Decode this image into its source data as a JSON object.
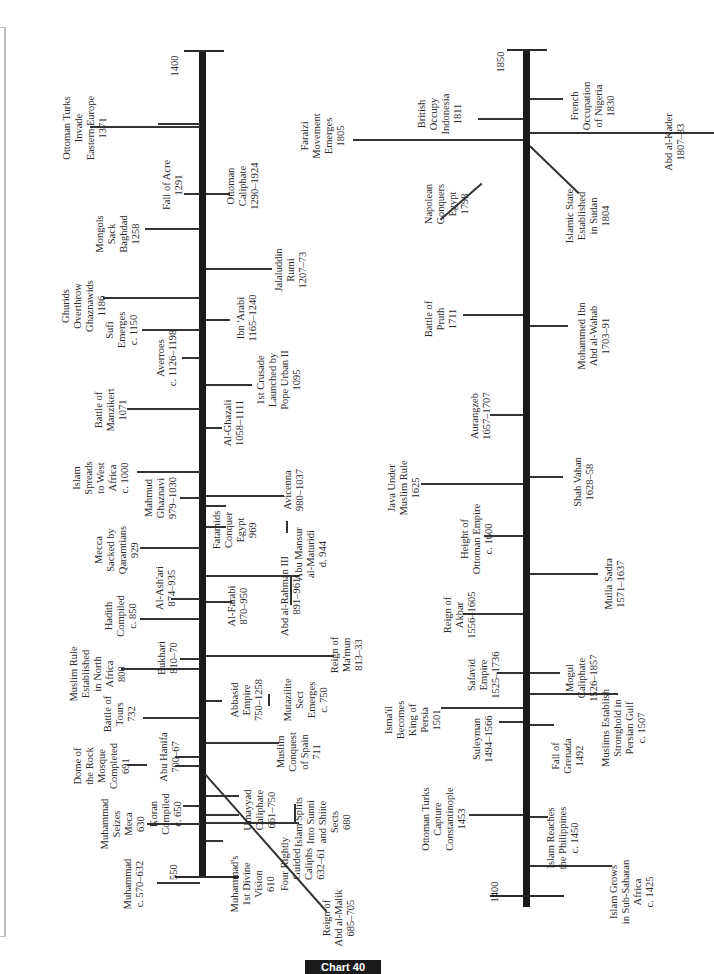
{
  "diagram": {
    "title": "Chart 40",
    "left_timeline": {
      "start_label": "550",
      "end_label": "1400",
      "events": [
        {
          "id": "muhammad",
          "text": "Muhammad\nc. 570–632"
        },
        {
          "id": "vision",
          "text": "Muhammad's\n1st Divine\nVision\n610"
        },
        {
          "id": "seizes-mecca",
          "text": "Muhammad\nSeizes\nMeca\n630"
        },
        {
          "id": "four-caliphs",
          "text": "Four Rightly\nGuided\nCaliphs\n632–61"
        },
        {
          "id": "koran",
          "text": "Koran\nCompiled\nc. 650"
        },
        {
          "id": "umayyad",
          "text": "Umayyad\nCaliphate\n661–750"
        },
        {
          "id": "split",
          "text": "Islam Splits\nInto Sunni\nand Shiite\nSects\n680"
        },
        {
          "id": "abd-al-malik",
          "text": "Reign of\nAbd al-Malik\n685–705"
        },
        {
          "id": "dome",
          "text": "Dome of\nthe Rock\nMosque\nCompleted\n691"
        },
        {
          "id": "abu-hanifa",
          "text": "Abu Hanifa\n700–67"
        },
        {
          "id": "spain",
          "text": "Muslim\nConquest\nof Spain\n711"
        },
        {
          "id": "tours",
          "text": "Battle of\nTours\n732"
        },
        {
          "id": "abbasid",
          "text": "Abbasid\nEmpire\n750–1258"
        },
        {
          "id": "mutazilite",
          "text": "Mutazilite\nSect\nEmerges\nc. 750"
        },
        {
          "id": "north-africa",
          "text": "Muslim Rule\nEstablished\nin North\nAfrica\n800"
        },
        {
          "id": "bukhari",
          "text": "Bukhari\n810–70"
        },
        {
          "id": "mamun",
          "text": "Reign of\nMa'mun\n813–33"
        },
        {
          "id": "hadith",
          "text": "Hadith\nCompiled\nc. 850"
        },
        {
          "id": "farabi",
          "text": "Al-Farabi\n870–950"
        },
        {
          "id": "ashari",
          "text": "Al-Ash'ari\n874–935"
        },
        {
          "id": "abd-rahman",
          "text": "Abd al-Rahman III\n891–961"
        },
        {
          "id": "mecca-sacked",
          "text": "Mecca\nSacked by\nQaramtians\n929"
        },
        {
          "id": "maturidi",
          "text": "Abu Mansur\nal-Maturidi\nd. 944"
        },
        {
          "id": "fatamids",
          "text": "Fatamids\nConquer\nEgypt\n969"
        },
        {
          "id": "mahmud",
          "text": "Mahmud\nGhaznavi\n979–1030"
        },
        {
          "id": "avicenna",
          "text": "Avicenna\n980–1037"
        },
        {
          "id": "west-africa",
          "text": "Islam\nSpreads\nto West\nAfrica\nc. 1000"
        },
        {
          "id": "ghazali",
          "text": "Al-Ghazali\n1058–1111"
        },
        {
          "id": "manzikert",
          "text": "Battle of\nManzikert\n1071"
        },
        {
          "id": "crusade",
          "text": "1st Crusade\nLaunched by\nPope Urban II\n1095"
        },
        {
          "id": "averroes",
          "text": "Averroes\nc. 1126–1198"
        },
        {
          "id": "sufi",
          "text": "Sufi\nEmerges\nc. 1150"
        },
        {
          "id": "ibn-arabi",
          "text": "Ibn 'Arabi\n1165–1240"
        },
        {
          "id": "ghurids",
          "text": "Ghurids\nOverthrow\nGhaznawids\n1186"
        },
        {
          "id": "rumi",
          "text": "Jalaluddin\nRumi\n1207–73"
        },
        {
          "id": "baghdad",
          "text": "Mongols\nSack\nBaghdad\n1258"
        },
        {
          "id": "ottoman-caliphate",
          "text": "Ottoman\nCaliphate\n1290–1924"
        },
        {
          "id": "acre",
          "text": "Fall of Acre\n1291"
        },
        {
          "id": "ottoman-invade",
          "text": "Ottoman Turks\nInvade\nEastern Europe\n1371"
        }
      ]
    },
    "right_timeline": {
      "start_label": "1400",
      "end_label": "1850",
      "events": [
        {
          "id": "sub-saharan",
          "text": "Islam Grows\nin Sub-Saharan\nAfrica\nc. 1425"
        },
        {
          "id": "philippines",
          "text": "Islam Reaches\nthe Philippines\nc. 1450"
        },
        {
          "id": "constantinople",
          "text": "Ottoman Turks\nCapture\nConstantinople\n1453"
        },
        {
          "id": "grenada",
          "text": "Fall of\nGrenada\n1492"
        },
        {
          "id": "suleyman",
          "text": "Suleyman\n1494–1566"
        },
        {
          "id": "ismail",
          "text": "Isma'il\nBecomes\nKing of\nPersia\n1501"
        },
        {
          "id": "persian-gulf",
          "text": "Muslims Establish\nStronghold in\nPersian Gulf\nc. 1507"
        },
        {
          "id": "safavid",
          "text": "Safavid\nEmpire\n1525–1736"
        },
        {
          "id": "mogul",
          "text": "Mogul\nCaliphate\n1526–1857"
        },
        {
          "id": "akbar",
          "text": "Reign of\nAkbar\n1556–1605"
        },
        {
          "id": "mulla-sadra",
          "text": "Mulla Sadra\n1571–1637"
        },
        {
          "id": "height-ottoman",
          "text": "Height of\nOttoman Empire\nc. 1600"
        },
        {
          "id": "java",
          "text": "Java Under\nMuslim Rule\n1625"
        },
        {
          "id": "shah-vahan",
          "text": "Shah Vahan\n1628–58"
        },
        {
          "id": "aurangzeb",
          "text": "Aurangzeb\n1657–1707"
        },
        {
          "id": "wahab",
          "text": "Mohammed Ibn\nAbd al-Wahab\n1703–91"
        },
        {
          "id": "pruth",
          "text": "Battle of\nPruth\n1711"
        },
        {
          "id": "napolean",
          "text": "Napolean\nConquers\nEgypt\n1798"
        },
        {
          "id": "sudan",
          "text": "Islamic State\nEstablished\nin Sudan\n1804"
        },
        {
          "id": "faraizi",
          "text": "Faraizi\nMovement\nEmerges\n1805"
        },
        {
          "id": "abd-al-kader",
          "text": "Abd al-Kader\n1807–83"
        },
        {
          "id": "indonesia",
          "text": "British\nOccupy\nIndonesia\n1811"
        },
        {
          "id": "nigeria",
          "text": "French\nOccupation\nof Nigeria\n1830"
        }
      ]
    }
  }
}
